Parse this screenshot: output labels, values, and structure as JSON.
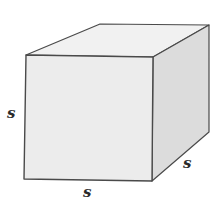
{
  "diagram": {
    "title": "",
    "shape": "cube",
    "labels": {
      "height": "s",
      "width": "s",
      "depth": "s"
    },
    "colors": {
      "front_face": "#ececec",
      "top_face": "#f1f1f1",
      "side_face": "#dcdcdc",
      "edge": "#4a4a4a",
      "background": "#ffffff"
    }
  }
}
